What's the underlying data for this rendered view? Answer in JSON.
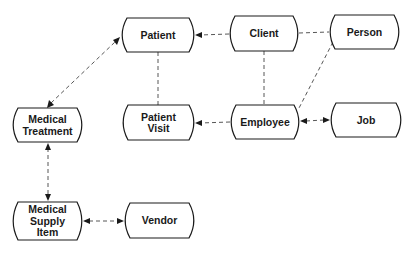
{
  "diagram": {
    "type": "entity-relationship",
    "nodes": [
      {
        "id": "patient",
        "lines": [
          "Patient"
        ],
        "x": 121,
        "y": 18,
        "w": 74,
        "h": 34
      },
      {
        "id": "client",
        "lines": [
          "Client"
        ],
        "x": 229,
        "y": 16,
        "w": 70,
        "h": 35
      },
      {
        "id": "person",
        "lines": [
          "Person"
        ],
        "x": 329,
        "y": 15,
        "w": 71,
        "h": 34
      },
      {
        "id": "medical-treatment",
        "lines": [
          "Medical",
          "Treatment"
        ],
        "x": 12,
        "y": 108,
        "w": 71,
        "h": 34
      },
      {
        "id": "patient-visit",
        "lines": [
          "Patient",
          "Visit"
        ],
        "x": 122,
        "y": 105,
        "w": 73,
        "h": 35
      },
      {
        "id": "employee",
        "lines": [
          "Employee"
        ],
        "x": 230,
        "y": 105,
        "w": 70,
        "h": 34
      },
      {
        "id": "job",
        "lines": [
          "Job"
        ],
        "x": 330,
        "y": 103,
        "w": 72,
        "h": 34
      },
      {
        "id": "medical-supply-item",
        "lines": [
          "Medical",
          "Supply",
          "Item"
        ],
        "x": 12,
        "y": 202,
        "w": 71,
        "h": 38
      },
      {
        "id": "vendor",
        "lines": [
          "Vendor"
        ],
        "x": 124,
        "y": 203,
        "w": 71,
        "h": 35
      }
    ],
    "edges": [
      {
        "from": "client",
        "to": "patient",
        "arrow_end": true,
        "arrow_start": false
      },
      {
        "from": "person",
        "to": "client",
        "arrow_end": false,
        "arrow_start": false
      },
      {
        "from": "patient",
        "to": "patient-visit",
        "arrow_end": false,
        "arrow_start": false
      },
      {
        "from": "client",
        "to": "employee",
        "arrow_end": false,
        "arrow_start": false
      },
      {
        "from": "person",
        "to": "employee",
        "arrow_end": false,
        "arrow_start": false
      },
      {
        "from": "employee",
        "to": "patient-visit",
        "arrow_end": true,
        "arrow_start": false
      },
      {
        "from": "employee",
        "to": "job",
        "arrow_end": true,
        "arrow_start": true
      },
      {
        "from": "medical-treatment",
        "to": "patient",
        "arrow_end": true,
        "arrow_start": true
      },
      {
        "from": "medical-treatment",
        "to": "medical-supply-item",
        "arrow_end": true,
        "arrow_start": true
      },
      {
        "from": "medical-supply-item",
        "to": "vendor",
        "arrow_end": true,
        "arrow_start": true
      }
    ]
  }
}
